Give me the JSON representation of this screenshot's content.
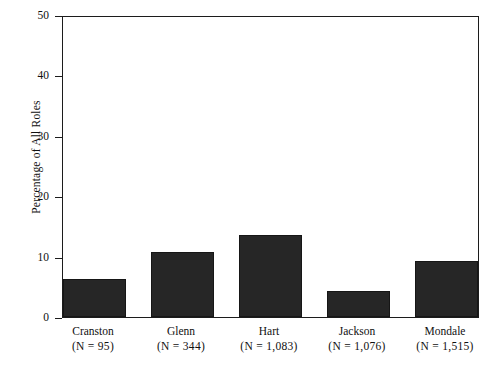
{
  "chart_data": {
    "type": "bar",
    "title": "",
    "subtitle": "",
    "xlabel": "",
    "ylabel": "Percentage of All Roles",
    "categories": [
      "Cranston",
      "Glenn",
      "Hart",
      "Jackson",
      "Mondale"
    ],
    "category_sublabels": [
      "(N = 95)",
      "(N = 344)",
      "(N = 1,083)",
      "(N = 1,076)",
      "(N = 1,515)"
    ],
    "values": [
      6.3,
      10.7,
      13.5,
      4.3,
      9.2
    ],
    "ylim": [
      0,
      50
    ],
    "yticks": [
      0,
      10,
      20,
      30,
      40,
      50
    ],
    "ytick_labels": [
      "0",
      "10",
      "20",
      "30",
      "40",
      "50"
    ],
    "xticks": [],
    "grid": false,
    "legend": false,
    "legend_position": "none",
    "bar_color": "#262626",
    "bar_edge_color": "#161616",
    "axis_color": "#1c1c1c",
    "background_color": "#ffffff",
    "series": [
      {
        "name": "Percentage of All Roles",
        "values": [
          6.3,
          10.7,
          13.5,
          4.3,
          9.2
        ]
      }
    ]
  }
}
